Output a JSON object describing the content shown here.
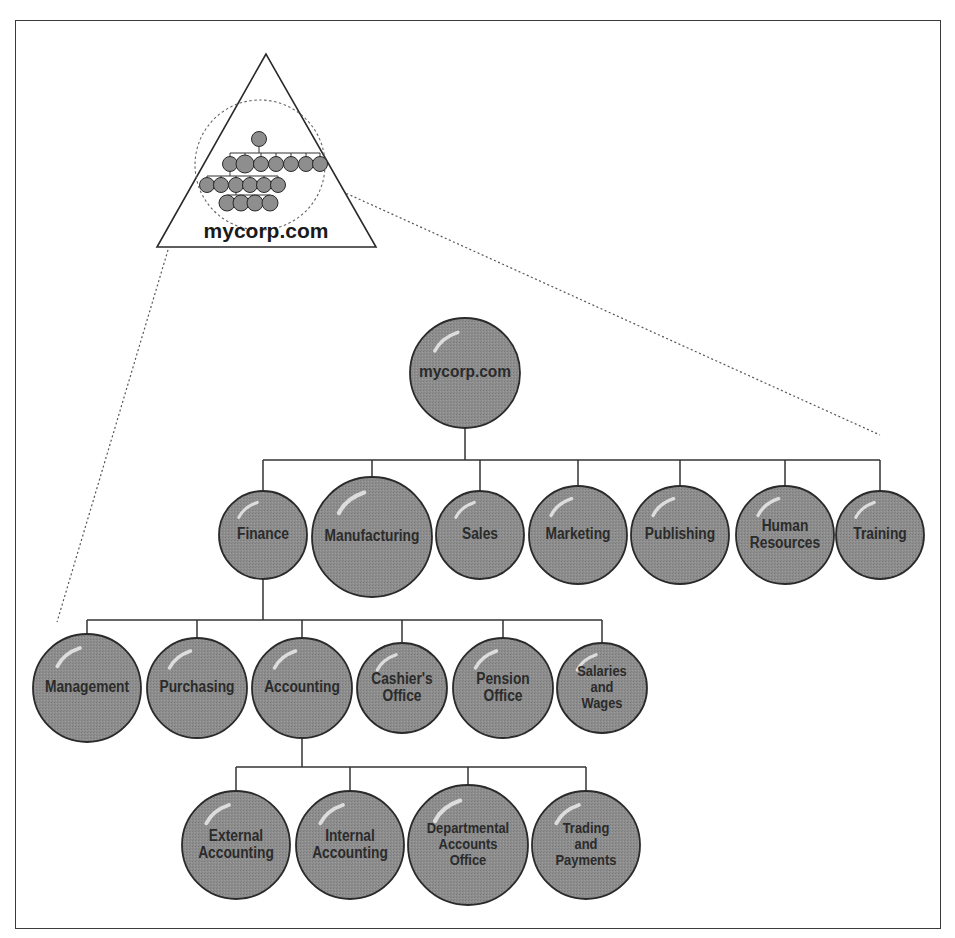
{
  "diagram": {
    "type": "org-chart",
    "overview": {
      "label": "mycorp.com",
      "shape": "triangle",
      "note": "zoom-in callout from triangle overview to full hierarchy"
    },
    "colors": {
      "node_fill": "#8c8c8c",
      "node_stroke": "#2a2a2a",
      "node_highlight": "#e6e6e6",
      "line": "#333333",
      "text": "#2b2b2b",
      "frame": "#3a3a3a"
    },
    "root": {
      "label": "mycorp.com"
    },
    "level1": [
      {
        "id": "finance",
        "lines": [
          "Finance"
        ]
      },
      {
        "id": "manufacturing",
        "lines": [
          "Manufacturing"
        ]
      },
      {
        "id": "sales",
        "lines": [
          "Sales"
        ]
      },
      {
        "id": "marketing",
        "lines": [
          "Marketing"
        ]
      },
      {
        "id": "publishing",
        "lines": [
          "Publishing"
        ]
      },
      {
        "id": "human-resources",
        "lines": [
          "Human",
          "Resources"
        ]
      },
      {
        "id": "training",
        "lines": [
          "Training"
        ]
      }
    ],
    "level2_parent": "Finance",
    "level2": [
      {
        "id": "management",
        "lines": [
          "Management"
        ]
      },
      {
        "id": "purchasing",
        "lines": [
          "Purchasing"
        ]
      },
      {
        "id": "accounting",
        "lines": [
          "Accounting"
        ]
      },
      {
        "id": "cashiers-office",
        "lines": [
          "Cashier's",
          "Office"
        ]
      },
      {
        "id": "pension-office",
        "lines": [
          "Pension",
          "Office"
        ]
      },
      {
        "id": "salaries-and-wages",
        "lines": [
          "Salaries",
          "and",
          "Wages"
        ]
      }
    ],
    "level3_parent": "Accounting",
    "level3": [
      {
        "id": "external-accounting",
        "lines": [
          "External",
          "Accounting"
        ]
      },
      {
        "id": "internal-accounting",
        "lines": [
          "Internal",
          "Accounting"
        ]
      },
      {
        "id": "departmental-accounts-office",
        "lines": [
          "Departmental",
          "Accounts",
          "Office"
        ]
      },
      {
        "id": "trading-and-payments",
        "lines": [
          "Trading",
          "and",
          "Payments"
        ]
      }
    ]
  }
}
